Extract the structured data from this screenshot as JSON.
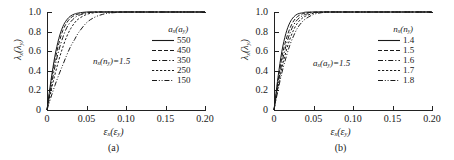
{
  "figure": {
    "panels": [
      {
        "id": "a",
        "caption": "(a)",
        "annotation": "n_x(n_y)=1.5",
        "legend_title": "a_x(a_y)"
      },
      {
        "id": "b",
        "caption": "(b)",
        "annotation": "a_x(a_y)=1.5",
        "legend_title": "n_x(n_y)"
      }
    ]
  },
  "axes": {
    "ylabel": "lambda_x(lambda_y)",
    "xlabel": "epsilon_x(epsilon_y)",
    "yticks": [
      "1.0",
      "0.8",
      "0.6",
      "0.4",
      "0.2",
      "0"
    ],
    "ytick_values": [
      1.0,
      0.8,
      0.6,
      0.4,
      0.2,
      0.0
    ],
    "xticks": [
      "0",
      "0.05",
      "0.10",
      "0.15",
      "0.20"
    ],
    "xtick_values": [
      0,
      0.05,
      0.1,
      0.15,
      0.2
    ],
    "xlim": [
      0,
      0.2
    ],
    "ylim": [
      0,
      1.0
    ]
  },
  "chart_data": [
    {
      "type": "line",
      "panel": "a",
      "title": "(a)",
      "xlabel": "εx(εy)",
      "ylabel": "λx(λy)",
      "xlim": [
        0,
        0.2
      ],
      "ylim": [
        0,
        1.0
      ],
      "grid": false,
      "legend_position": "upper right",
      "legend_title": "ax(ay)",
      "annotation": "nx(ny)=1.5",
      "x": [
        0,
        0.005,
        0.01,
        0.015,
        0.02,
        0.025,
        0.03,
        0.035,
        0.04,
        0.05,
        0.06,
        0.07,
        0.08,
        0.1,
        0.12,
        0.15,
        0.2
      ],
      "series": [
        {
          "name": "550",
          "linestyle": "solid",
          "values": [
            0,
            0.3,
            0.55,
            0.73,
            0.85,
            0.92,
            0.96,
            0.98,
            0.99,
            1.0,
            1.0,
            1.0,
            1.0,
            1.0,
            1.0,
            1.0,
            1.0
          ]
        },
        {
          "name": "450",
          "linestyle": "dashed",
          "values": [
            0,
            0.27,
            0.5,
            0.68,
            0.81,
            0.89,
            0.94,
            0.965,
            0.98,
            0.995,
            1.0,
            1.0,
            1.0,
            1.0,
            1.0,
            1.0,
            1.0
          ]
        },
        {
          "name": "350",
          "linestyle": "dashdot",
          "values": [
            0,
            0.23,
            0.44,
            0.61,
            0.74,
            0.84,
            0.9,
            0.94,
            0.965,
            0.99,
            1.0,
            1.0,
            1.0,
            1.0,
            1.0,
            1.0,
            1.0
          ]
        },
        {
          "name": "250",
          "linestyle": "shortdash",
          "values": [
            0,
            0.19,
            0.36,
            0.51,
            0.64,
            0.75,
            0.83,
            0.89,
            0.93,
            0.975,
            0.993,
            1.0,
            1.0,
            1.0,
            1.0,
            1.0,
            1.0
          ]
        },
        {
          "name": "150",
          "linestyle": "dashdotdot",
          "values": [
            0,
            0.13,
            0.25,
            0.36,
            0.46,
            0.56,
            0.65,
            0.72,
            0.79,
            0.89,
            0.945,
            0.975,
            0.99,
            1.0,
            1.0,
            1.0,
            1.0
          ]
        }
      ]
    },
    {
      "type": "line",
      "panel": "b",
      "title": "(b)",
      "xlabel": "εx(εy)",
      "ylabel": "λx(λy)",
      "xlim": [
        0,
        0.2
      ],
      "ylim": [
        0,
        1.0
      ],
      "grid": false,
      "legend_position": "upper right",
      "legend_title": "nx(ny)",
      "annotation": "ax(ay)=1.5",
      "x": [
        0,
        0.005,
        0.01,
        0.015,
        0.02,
        0.025,
        0.03,
        0.035,
        0.04,
        0.05,
        0.06,
        0.07,
        0.08,
        0.1,
        0.12,
        0.15,
        0.2
      ],
      "series": [
        {
          "name": "1.4",
          "linestyle": "solid",
          "values": [
            0,
            0.33,
            0.6,
            0.78,
            0.89,
            0.95,
            0.98,
            0.99,
            0.998,
            1.0,
            1.0,
            1.0,
            1.0,
            1.0,
            1.0,
            1.0,
            1.0
          ]
        },
        {
          "name": "1.5",
          "linestyle": "dashed",
          "values": [
            0,
            0.29,
            0.54,
            0.71,
            0.83,
            0.91,
            0.955,
            0.978,
            0.99,
            0.999,
            1.0,
            1.0,
            1.0,
            1.0,
            1.0,
            1.0,
            1.0
          ]
        },
        {
          "name": "1.6",
          "linestyle": "dashdot",
          "values": [
            0,
            0.26,
            0.48,
            0.65,
            0.78,
            0.87,
            0.925,
            0.957,
            0.976,
            0.995,
            1.0,
            1.0,
            1.0,
            1.0,
            1.0,
            1.0,
            1.0
          ]
        },
        {
          "name": "1.7",
          "linestyle": "shortdash",
          "values": [
            0,
            0.23,
            0.43,
            0.59,
            0.72,
            0.82,
            0.89,
            0.932,
            0.958,
            0.988,
            0.998,
            1.0,
            1.0,
            1.0,
            1.0,
            1.0,
            1.0
          ]
        },
        {
          "name": "1.8",
          "linestyle": "dashdotdot",
          "values": [
            0,
            0.2,
            0.38,
            0.53,
            0.66,
            0.76,
            0.84,
            0.893,
            0.93,
            0.975,
            0.993,
            0.999,
            1.0,
            1.0,
            1.0,
            1.0,
            1.0
          ]
        }
      ]
    }
  ],
  "style": {
    "line_color": "#1a1a1a",
    "axis_color": "#222222",
    "background": "#ffffff"
  }
}
